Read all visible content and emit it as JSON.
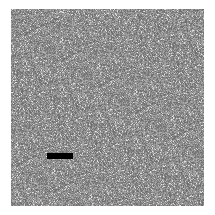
{
  "image": {
    "background_color": "#ffffff",
    "noise_field": {
      "base_color": "#8c8c8c",
      "light_speckle_color": "#c8c8c8",
      "dark_speckle_color": "#6e6e6e"
    },
    "marker_bar": {
      "color": "#000000"
    }
  }
}
